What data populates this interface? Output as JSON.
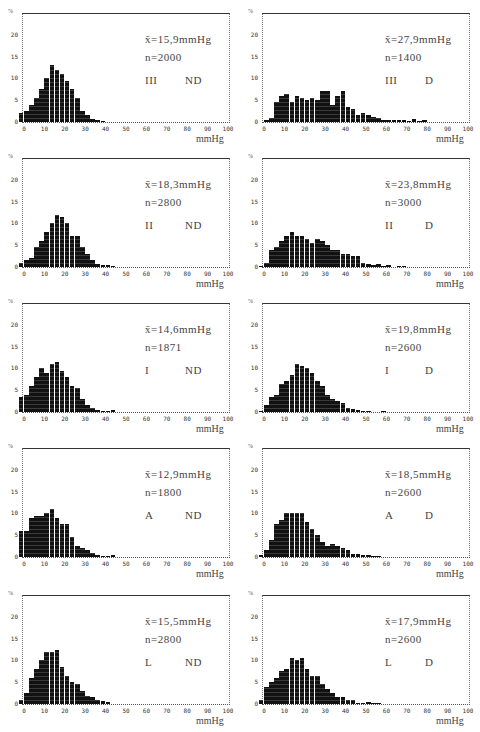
{
  "figure": {
    "y_unit": "%",
    "x_unit": "mmHg",
    "y_ticks": [
      0,
      5,
      10,
      15,
      20
    ],
    "x_ticks": [
      0,
      10,
      20,
      30,
      40,
      50,
      60,
      70,
      80,
      90,
      100
    ]
  },
  "chart_data": [
    {
      "type": "bar",
      "panel": "III ND",
      "group": "III",
      "condition": "ND",
      "mean_label": "x̄=15,9mmHg",
      "n_label": "n=2000",
      "mean": 15.9,
      "n": 2000,
      "xlabel": "mmHg",
      "ylabel": "%",
      "xlim": [
        0,
        100
      ],
      "ylim": [
        0,
        25
      ],
      "bin_width": 2.5,
      "x": [
        -2.5,
        0,
        2.5,
        5,
        7.5,
        10,
        12.5,
        15,
        17.5,
        20,
        22.5,
        25,
        27.5,
        30,
        32.5,
        35,
        37.5
      ],
      "values": [
        2,
        2.5,
        4,
        5.5,
        7.5,
        10,
        13,
        12,
        11,
        9.5,
        7.5,
        5.5,
        2.5,
        1.5,
        0.8,
        0.4,
        0.2
      ]
    },
    {
      "type": "bar",
      "panel": "III D",
      "group": "III",
      "condition": "D",
      "mean_label": "x̄=27,9mmHg",
      "n_label": "n=1400",
      "mean": 27.9,
      "n": 1400,
      "xlabel": "mmHg",
      "ylabel": "%",
      "xlim": [
        0,
        100
      ],
      "ylim": [
        0,
        25
      ],
      "bin_width": 2.5,
      "x": [
        0,
        2.5,
        5,
        7.5,
        10,
        12.5,
        15,
        17.5,
        20,
        22.5,
        25,
        27.5,
        30,
        32.5,
        35,
        37.5,
        40,
        42.5,
        45,
        47.5,
        50,
        52.5,
        55,
        57.5,
        60,
        62.5,
        65,
        67.5,
        70,
        72.5,
        75,
        77.5
      ],
      "values": [
        0.4,
        1,
        4.5,
        6,
        6.5,
        4.5,
        6,
        5.5,
        5,
        5.5,
        5,
        7,
        7,
        4,
        6,
        7,
        3.5,
        3,
        1.5,
        2,
        1.5,
        1.2,
        1,
        0.5,
        0.5,
        0.5,
        0.4,
        0.4,
        0.3,
        0.8,
        0.2,
        0.5
      ]
    },
    {
      "type": "bar",
      "panel": "II ND",
      "group": "II",
      "condition": "ND",
      "mean_label": "x̄=18,3mmHg",
      "n_label": "n=2800",
      "mean": 18.3,
      "n": 2800,
      "xlabel": "mmHg",
      "ylabel": "%",
      "xlim": [
        0,
        100
      ],
      "ylim": [
        0,
        25
      ],
      "bin_width": 2.5,
      "x": [
        -2.5,
        0,
        2.5,
        5,
        7.5,
        10,
        12.5,
        15,
        17.5,
        20,
        22.5,
        25,
        27.5,
        30,
        32.5,
        35,
        37.5,
        40,
        42.5
      ],
      "values": [
        1,
        1.5,
        2,
        4.5,
        6,
        8,
        10,
        12,
        11.5,
        10,
        7,
        7,
        4.5,
        3,
        1.5,
        0.8,
        0.5,
        0.4,
        0.3
      ]
    },
    {
      "type": "bar",
      "panel": "II D",
      "group": "II",
      "condition": "D",
      "mean_label": "x̄=23,8mmHg",
      "n_label": "n=3000",
      "mean": 23.8,
      "n": 3000,
      "xlabel": "mmHg",
      "ylabel": "%",
      "xlim": [
        0,
        100
      ],
      "ylim": [
        0,
        25
      ],
      "bin_width": 2.5,
      "x": [
        -2.5,
        0,
        2.5,
        5,
        7.5,
        10,
        12.5,
        15,
        17.5,
        20,
        22.5,
        25,
        27.5,
        30,
        32.5,
        35,
        37.5,
        40,
        42.5,
        45,
        47.5,
        50,
        52.5,
        55,
        57.5,
        60,
        65,
        67.5
      ],
      "values": [
        0.3,
        1,
        4,
        4.5,
        6,
        7,
        8,
        7,
        7,
        6.5,
        5.5,
        6.5,
        6,
        5,
        4,
        4,
        3,
        3,
        2.5,
        2.5,
        1,
        0.6,
        0.5,
        0.8,
        0.3,
        0.4,
        0.2,
        0.3
      ]
    },
    {
      "type": "bar",
      "panel": "I ND",
      "group": "I",
      "condition": "ND",
      "mean_label": "x̄=14,6mmHg",
      "n_label": "n=1871",
      "mean": 14.6,
      "n": 1871,
      "xlabel": "mmHg",
      "ylabel": "%",
      "xlim": [
        0,
        100
      ],
      "ylim": [
        0,
        25
      ],
      "bin_width": 2.5,
      "x": [
        -2.5,
        0,
        2.5,
        5,
        7.5,
        10,
        12.5,
        15,
        17.5,
        20,
        22.5,
        25,
        27.5,
        30,
        32.5,
        35,
        37.5,
        40,
        42.5
      ],
      "values": [
        3.5,
        4,
        6,
        8,
        10,
        9,
        11,
        11.5,
        9.5,
        8,
        6,
        5.5,
        3,
        1.5,
        1,
        0.5,
        0.3,
        0.3,
        0.5
      ]
    },
    {
      "type": "bar",
      "panel": "I D",
      "group": "I",
      "condition": "D",
      "mean_label": "x̄=19,8mmHg",
      "n_label": "n=2600",
      "mean": 19.8,
      "n": 2600,
      "xlabel": "mmHg",
      "ylabel": "%",
      "xlim": [
        0,
        100
      ],
      "ylim": [
        0,
        25
      ],
      "bin_width": 2.5,
      "x": [
        -2.5,
        0,
        2.5,
        5,
        7.5,
        10,
        12.5,
        15,
        17.5,
        20,
        22.5,
        25,
        27.5,
        30,
        32.5,
        35,
        37.5,
        40,
        42.5,
        45,
        47.5,
        50,
        57.5
      ],
      "values": [
        0.3,
        1.5,
        3.5,
        4,
        6.5,
        7,
        8.5,
        11,
        10.5,
        10,
        9,
        7,
        6,
        4,
        3,
        2.5,
        2,
        1,
        0.8,
        0.4,
        0.3,
        0.3,
        0.2
      ]
    },
    {
      "type": "bar",
      "panel": "A ND",
      "group": "A",
      "condition": "ND",
      "mean_label": "x̄=12,9mmHg",
      "n_label": "n=1800",
      "mean": 12.9,
      "n": 1800,
      "xlabel": "mmHg",
      "ylabel": "%",
      "xlim": [
        0,
        100
      ],
      "ylim": [
        0,
        25
      ],
      "bin_width": 2.5,
      "x": [
        -2.5,
        0,
        2.5,
        5,
        7.5,
        10,
        12.5,
        15,
        17.5,
        20,
        22.5,
        25,
        27.5,
        30,
        32.5,
        35,
        37.5,
        40,
        42.5
      ],
      "values": [
        6,
        6,
        9,
        9.5,
        9.5,
        10,
        11,
        9,
        7.5,
        7.5,
        4.5,
        2.5,
        2,
        1.5,
        1,
        0.5,
        0.3,
        0.3,
        0.5
      ]
    },
    {
      "type": "bar",
      "panel": "A D",
      "group": "A",
      "condition": "D",
      "mean_label": "x̄=18,5mmHg",
      "n_label": "n=2600",
      "mean": 18.5,
      "n": 2600,
      "xlabel": "mmHg",
      "ylabel": "%",
      "xlim": [
        0,
        100
      ],
      "ylim": [
        0,
        25
      ],
      "bin_width": 2.5,
      "x": [
        -2.5,
        0,
        2.5,
        5,
        7.5,
        10,
        12.5,
        15,
        17.5,
        20,
        22.5,
        25,
        27.5,
        30,
        32.5,
        35,
        37.5,
        40,
        42.5,
        45,
        47.5,
        50,
        52.5,
        55
      ],
      "values": [
        0.5,
        1.5,
        4,
        7.5,
        8.5,
        10,
        10,
        10,
        10,
        8,
        6.5,
        5,
        3.5,
        2.5,
        3,
        2.5,
        2,
        1.5,
        0.8,
        0.6,
        0.5,
        0.4,
        0.3,
        0.3
      ]
    },
    {
      "type": "bar",
      "panel": "L ND",
      "group": "L",
      "condition": "ND",
      "mean_label": "x̄=15,5mmHg",
      "n_label": "n=2800",
      "mean": 15.5,
      "n": 2800,
      "xlabel": "mmHg",
      "ylabel": "%",
      "xlim": [
        0,
        100
      ],
      "ylim": [
        0,
        25
      ],
      "bin_width": 2.5,
      "x": [
        -2.5,
        0,
        2.5,
        5,
        7.5,
        10,
        12.5,
        15,
        17.5,
        20,
        22.5,
        25,
        27.5,
        30,
        32.5,
        35,
        37.5,
        40
      ],
      "values": [
        1,
        2.5,
        6,
        8,
        10,
        12,
        12,
        12.5,
        8.5,
        6.5,
        5,
        4.5,
        3,
        1.8,
        1.5,
        1,
        0.6,
        0.4
      ]
    },
    {
      "type": "bar",
      "panel": "L D",
      "group": "L",
      "condition": "D",
      "mean_label": "x̄=17,9mmHg",
      "n_label": "n=2600",
      "mean": 17.9,
      "n": 2600,
      "xlabel": "mmHg",
      "ylabel": "%",
      "xlim": [
        0,
        100
      ],
      "ylim": [
        0,
        25
      ],
      "bin_width": 2.5,
      "x": [
        -2.5,
        0,
        2.5,
        5,
        7.5,
        10,
        12.5,
        15,
        17.5,
        20,
        22.5,
        25,
        27.5,
        30,
        32.5,
        35,
        37.5,
        40,
        42.5,
        45,
        47.5,
        50,
        52.5,
        55
      ],
      "values": [
        1,
        4,
        5,
        6,
        7.5,
        8,
        10.5,
        10,
        10.5,
        8,
        6.5,
        6.5,
        4.5,
        3.5,
        2.5,
        1.5,
        1.5,
        1,
        1,
        0.2,
        0.2,
        0.4,
        0.3,
        0.3
      ]
    }
  ],
  "panels": [
    {
      "mean": "x̄=15,9mmHg",
      "n": "n=2000",
      "grp": "III",
      "cond": "ND"
    },
    {
      "mean": "x̄=27,9mmHg",
      "n": "n=1400",
      "grp": "III",
      "cond": "D"
    },
    {
      "mean": "x̄=18,3mmHg",
      "n": "n=2800",
      "grp": "II",
      "cond": "ND"
    },
    {
      "mean": "x̄=23,8mmHg",
      "n": "n=3000",
      "grp": "II",
      "cond": "D"
    },
    {
      "mean": "x̄=14,6mmHg",
      "n": "n=1871",
      "grp": "I",
      "cond": "ND"
    },
    {
      "mean": "x̄=19,8mmHg",
      "n": "n=2600",
      "grp": "I",
      "cond": "D"
    },
    {
      "mean": "x̄=12,9mmHg",
      "n": "n=1800",
      "grp": "A",
      "cond": "ND"
    },
    {
      "mean": "x̄=18,5mmHg",
      "n": "n=2600",
      "grp": "A",
      "cond": "D"
    },
    {
      "mean": "x̄=15,5mmHg",
      "n": "n=2800",
      "grp": "L",
      "cond": "ND"
    },
    {
      "mean": "x̄=17,9mmHg",
      "n": "n=2600",
      "grp": "L",
      "cond": "D"
    }
  ]
}
